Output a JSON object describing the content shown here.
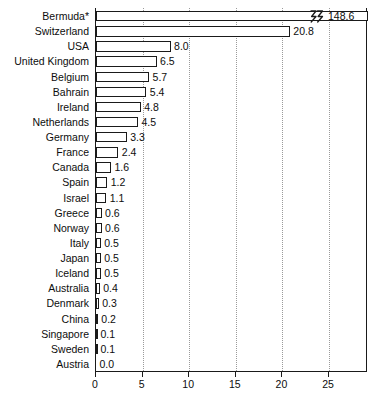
{
  "chart_data": {
    "type": "bar",
    "orientation": "horizontal",
    "title": "",
    "subtitle": "",
    "xlabel": "",
    "ylabel": "",
    "xlim": [
      0,
      29.2
    ],
    "xticks": [
      0,
      5,
      10,
      15,
      20,
      25
    ],
    "xtick_labels": [
      "0",
      "5",
      "10",
      "15",
      "20",
      "25"
    ],
    "grid": true,
    "grid_axis": "x",
    "grid_style": "dotted",
    "legend": false,
    "axis_break": {
      "present": true,
      "applies_to": "Bermuda*",
      "symbol": "zigzag",
      "note": "Bermuda bar is truncated with a break symbol; true value 148.6"
    },
    "categories": [
      "Bermuda*",
      "Switzerland",
      "USA",
      "United Kingdom",
      "Belgium",
      "Bahrain",
      "Ireland",
      "Netherlands",
      "Germany",
      "France",
      "Canada",
      "Spain",
      "Israel",
      "Greece",
      "Norway",
      "Italy",
      "Japan",
      "Iceland",
      "Australia",
      "Denmark",
      "China",
      "Singapore",
      "Sweden",
      "Austria"
    ],
    "values": [
      148.6,
      20.8,
      8.0,
      6.5,
      5.7,
      5.4,
      4.8,
      4.5,
      3.3,
      2.4,
      1.6,
      1.2,
      1.1,
      0.6,
      0.6,
      0.5,
      0.5,
      0.5,
      0.4,
      0.3,
      0.2,
      0.1,
      0.1,
      0.0
    ],
    "value_labels": [
      "148.6",
      "20.8",
      "8.0",
      "6.5",
      "5.7",
      "5.4",
      "4.8",
      "4.5",
      "3.3",
      "2.4",
      "1.6",
      "1.2",
      "1.1",
      "0.6",
      "0.6",
      "0.5",
      "0.5",
      "0.5",
      "0.4",
      "0.3",
      "0.2",
      "0.1",
      "0.1",
      "0.0"
    ]
  },
  "colors": {
    "bar_fill": "#ffffff",
    "bar_stroke": "#1a1a1a",
    "axis": "#1a1a1a",
    "grid": "#9a9a9a",
    "text": "#0d0d0d",
    "background": "#ffffff"
  }
}
